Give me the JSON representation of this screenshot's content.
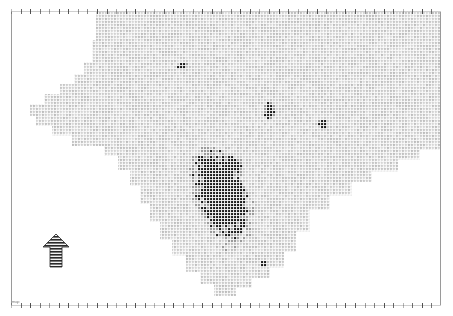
{
  "figure": {
    "type": "raster-map",
    "width": 453,
    "height": 316,
    "background_color": "#ffffff",
    "corner_label": "map"
  },
  "frame": {
    "left_axis_label": "",
    "right_axis_label": "",
    "axis_line_color": "#9a9a9a",
    "tick_color": "#8d8d8d",
    "plot_left": 11,
    "plot_top": 11,
    "plot_right": 440,
    "plot_bottom": 306,
    "top_tick_count": 46,
    "bottom_tick_count": 46
  },
  "legend": {
    "north_arrow_label": "N",
    "north_arrow_name": "north-arrow-icon"
  },
  "chart_data": {
    "type": "heatmap",
    "title": "",
    "xlabel": "",
    "ylabel": "",
    "grid": true,
    "legend_position": "none",
    "colors": {
      "background": "#ffffff",
      "cell_light": "#c8c8c8",
      "cell_mid": "#9c9c9c",
      "cell_dark": "#1c1c1c",
      "grid_line": "#e8e8e8"
    },
    "cell_size_px": 3,
    "value_scale": [
      0,
      1,
      2
    ],
    "value_labels": [
      "outside",
      "low",
      "high"
    ],
    "region_outline_px": [
      [
        96,
        12
      ],
      [
        440,
        12
      ],
      [
        440,
        150
      ],
      [
        420,
        150
      ],
      [
        420,
        160
      ],
      [
        398,
        160
      ],
      [
        398,
        172
      ],
      [
        372,
        172
      ],
      [
        372,
        182
      ],
      [
        352,
        182
      ],
      [
        352,
        196
      ],
      [
        330,
        196
      ],
      [
        330,
        210
      ],
      [
        310,
        210
      ],
      [
        310,
        232
      ],
      [
        296,
        232
      ],
      [
        296,
        252
      ],
      [
        284,
        252
      ],
      [
        284,
        268
      ],
      [
        270,
        268
      ],
      [
        270,
        278
      ],
      [
        252,
        278
      ],
      [
        252,
        288
      ],
      [
        236,
        288
      ],
      [
        236,
        296
      ],
      [
        214,
        296
      ],
      [
        214,
        284
      ],
      [
        200,
        284
      ],
      [
        200,
        272
      ],
      [
        186,
        272
      ],
      [
        186,
        256
      ],
      [
        172,
        256
      ],
      [
        172,
        240
      ],
      [
        160,
        240
      ],
      [
        160,
        222
      ],
      [
        150,
        222
      ],
      [
        150,
        204
      ],
      [
        140,
        204
      ],
      [
        140,
        186
      ],
      [
        130,
        186
      ],
      [
        130,
        170
      ],
      [
        118,
        170
      ],
      [
        118,
        156
      ],
      [
        104,
        156
      ],
      [
        104,
        146
      ],
      [
        72,
        146
      ],
      [
        72,
        136
      ],
      [
        52,
        136
      ],
      [
        52,
        126
      ],
      [
        36,
        126
      ],
      [
        36,
        116
      ],
      [
        30,
        116
      ],
      [
        30,
        104
      ],
      [
        44,
        104
      ],
      [
        44,
        94
      ],
      [
        60,
        94
      ],
      [
        60,
        84
      ],
      [
        74,
        84
      ],
      [
        74,
        74
      ],
      [
        84,
        74
      ],
      [
        84,
        62
      ],
      [
        92,
        62
      ],
      [
        92,
        40
      ],
      [
        96,
        40
      ]
    ],
    "dark_clusters": [
      {
        "name": "main-urban-cluster",
        "center_px": [
          222,
          196
        ],
        "approx_cells": 340,
        "bbox_px": [
          198,
          155,
          52,
          88
        ]
      },
      {
        "name": "north-patch",
        "center_px": [
          183,
          66
        ],
        "approx_cells": 5,
        "bbox_px": [
          178,
          62,
          10,
          8
        ]
      },
      {
        "name": "central-patch",
        "center_px": [
          270,
          112
        ],
        "approx_cells": 9,
        "bbox_px": [
          264,
          103,
          12,
          18
        ]
      },
      {
        "name": "east-patch",
        "center_px": [
          323,
          124
        ],
        "approx_cells": 6,
        "bbox_px": [
          319,
          119,
          8,
          10
        ]
      },
      {
        "name": "south-patch",
        "center_px": [
          264,
          264
        ],
        "approx_cells": 2,
        "bbox_px": [
          262,
          262,
          4,
          5
        ]
      }
    ]
  }
}
